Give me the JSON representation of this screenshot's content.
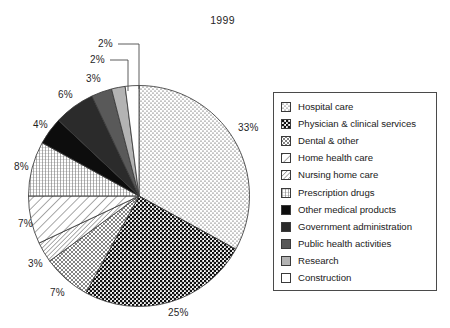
{
  "chart_data": {
    "type": "pie",
    "title": "1999",
    "categories": [
      "Hospital care",
      "Physician & clinical services",
      "Dental & other",
      "Nursing home care",
      "Home health care",
      "Prescription drugs",
      "Other medical products",
      "Government administration",
      "Public health activities",
      "Research",
      "Construction"
    ],
    "values": [
      33,
      25,
      7,
      3,
      7,
      8,
      4,
      6,
      3,
      2,
      2
    ],
    "value_labels": [
      "33%",
      "25%",
      "7%",
      "3%",
      "7%",
      "8%",
      "4%",
      "6%",
      "3%",
      "2%",
      "2%"
    ],
    "xlabel": "",
    "ylabel": "",
    "legend_position": "right",
    "start_angle_deg": 0,
    "direction": "clockwise",
    "units": "percent"
  },
  "header": {
    "title": "1999"
  },
  "slices": [
    {
      "id": "hospital-care",
      "label": "Hospital care",
      "value": 33,
      "value_label": "33%",
      "pattern": "fine-dots",
      "fill": "#ffffff"
    },
    {
      "id": "physician-clinical-services",
      "label": "Physician & clinical services",
      "value": 25,
      "value_label": "25%",
      "pattern": "coarse-dots",
      "fill": "#ffffff"
    },
    {
      "id": "dental-and-other",
      "label": "Dental & other",
      "value": 7,
      "value_label": "7%",
      "pattern": "fine-crosshatch",
      "fill": "#ffffff"
    },
    {
      "id": "nursing-home-care",
      "label": "Nursing home care",
      "value": 3,
      "value_label": "3%",
      "pattern": "narrow-diagonal",
      "fill": "#ffffff"
    },
    {
      "id": "home-health-care",
      "label": "Home health care",
      "value": 7,
      "value_label": "7%",
      "pattern": "wide-diagonal",
      "fill": "#ffffff"
    },
    {
      "id": "prescription-drugs",
      "label": "Prescription drugs",
      "value": 8,
      "value_label": "8%",
      "pattern": "vertical-grid",
      "fill": "#ffffff"
    },
    {
      "id": "other-medical-products",
      "label": "Other medical products",
      "value": 4,
      "value_label": "4%",
      "pattern": "solid",
      "fill": "#0d0d0d"
    },
    {
      "id": "government-administration",
      "label": "Government administration",
      "value": 6,
      "value_label": "6%",
      "pattern": "solid",
      "fill": "#2b2b2b"
    },
    {
      "id": "public-health-activities",
      "label": "Public health activities",
      "value": 3,
      "value_label": "3%",
      "pattern": "solid",
      "fill": "#595959"
    },
    {
      "id": "research",
      "label": "Research",
      "value": 2,
      "value_label": "2%",
      "pattern": "solid",
      "fill": "#b3b3b3"
    },
    {
      "id": "construction",
      "label": "Construction",
      "value": 2,
      "value_label": "2%",
      "pattern": "solid",
      "fill": "#ffffff"
    }
  ],
  "legend": {
    "items": [
      {
        "label": "Hospital care"
      },
      {
        "label": "Physician & clinical services"
      },
      {
        "label": "Dental & other"
      },
      {
        "label": "Home health care"
      },
      {
        "label": "Nursing home care"
      },
      {
        "label": "Prescription drugs"
      },
      {
        "label": "Other medical products"
      },
      {
        "label": "Government administration"
      },
      {
        "label": "Public health activities"
      },
      {
        "label": "Research"
      },
      {
        "label": "Construction"
      }
    ]
  },
  "colors": {
    "outline": "#3a3a3a",
    "text": "#1a1a1a",
    "background": "#ffffff"
  }
}
